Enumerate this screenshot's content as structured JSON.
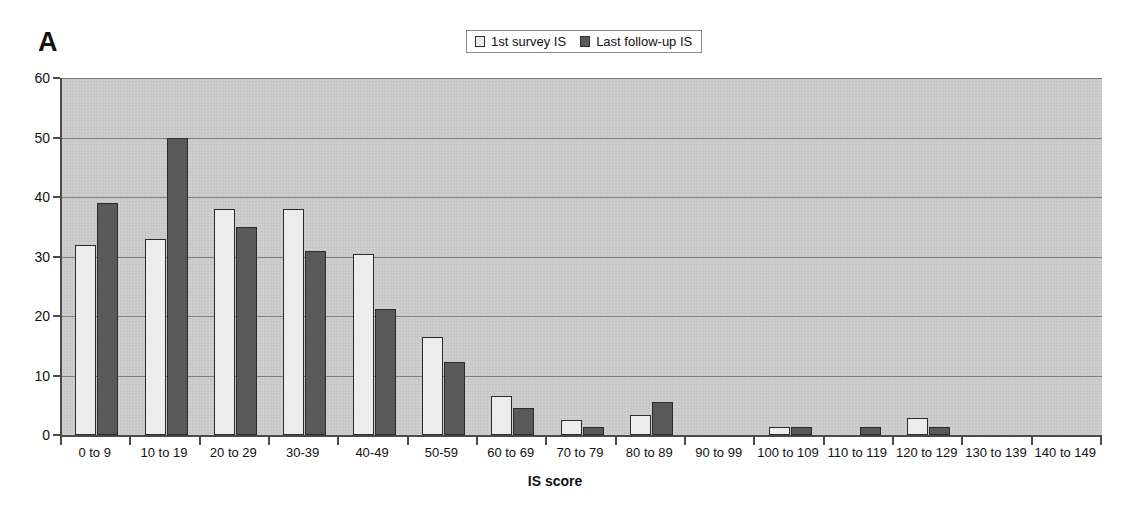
{
  "panel": {
    "label": "A"
  },
  "legend": {
    "entries": [
      {
        "label": "1st survey IS",
        "swatch_color": "#ededed",
        "swatch_name": "legend-swatch-first-survey"
      },
      {
        "label": "Last follow-up IS",
        "swatch_color": "#595959",
        "swatch_name": "legend-swatch-last-followup"
      }
    ]
  },
  "colors": {
    "plot_background": "#cccccc",
    "first_survey_bar": "#ededed",
    "last_followup_bar": "#595959",
    "gridline": "#7d7d7d",
    "axis": "#4a4a4a",
    "text": "#111111"
  },
  "chart_data": {
    "type": "bar",
    "title": "A",
    "xlabel": "IS score",
    "ylabel": "",
    "ylim": [
      0,
      60
    ],
    "yticks": [
      0,
      10,
      20,
      30,
      40,
      50,
      60
    ],
    "ytick_labels": [
      "0",
      "10",
      "20",
      "30",
      "40",
      "50",
      "60"
    ],
    "grid": true,
    "legend_position": "top-center",
    "categories": [
      "0 to 9",
      "10 to 19",
      "20 to 29",
      "30-39",
      "40-49",
      "50-59",
      "60 to 69",
      "70 to 79",
      "80 to 89",
      "90 to 99",
      "100 to 109",
      "110 to 119",
      "120 to 129",
      "130 to 139",
      "140 to 149"
    ],
    "series": [
      {
        "name": "1st survey IS",
        "color": "#ededed",
        "values": [
          32,
          33,
          38,
          38,
          30.5,
          16.5,
          6.5,
          2.5,
          3.4,
          0,
          1.3,
          0,
          2.8,
          0,
          0
        ]
      },
      {
        "name": "Last follow-up IS",
        "color": "#595959",
        "values": [
          39,
          50,
          35,
          31,
          21.2,
          12.3,
          4.5,
          1.3,
          5.5,
          0,
          1.3,
          1.4,
          1.4,
          0,
          0
        ]
      }
    ]
  }
}
